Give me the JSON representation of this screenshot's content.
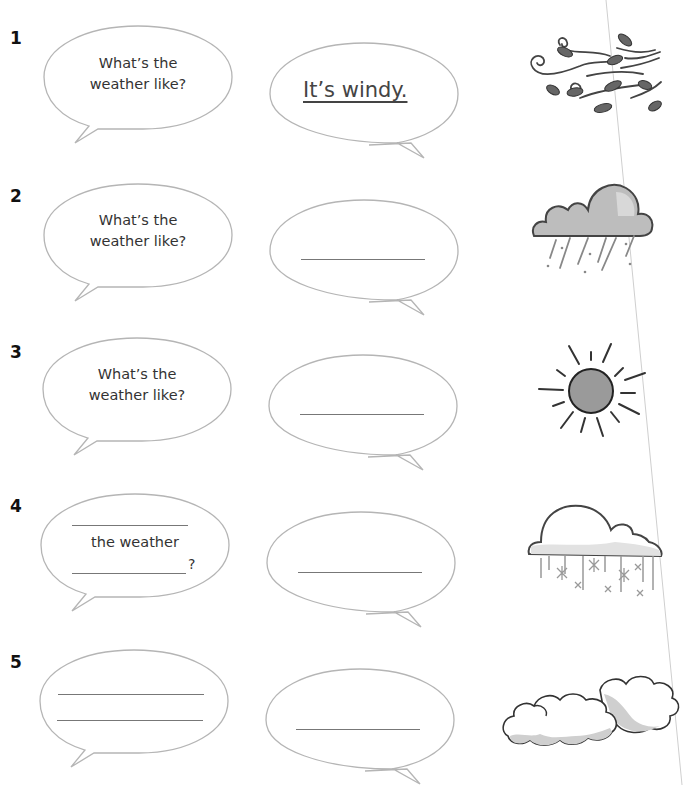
{
  "worksheet": {
    "items": [
      {
        "number": "1",
        "question_line1": "What’s the",
        "question_line2": "weather like?",
        "answer": "It’s windy.",
        "picture": "windy-icon"
      },
      {
        "number": "2",
        "question_line1": "What’s the",
        "question_line2": "weather like?",
        "answer": "",
        "picture": "rainy-cloud-icon"
      },
      {
        "number": "3",
        "question_line1": "What’s the",
        "question_line2": "weather like?",
        "answer": "",
        "picture": "sun-icon"
      },
      {
        "number": "4",
        "question_middle": "the weather",
        "question_end": "?",
        "answer": "",
        "picture": "snowy-cloud-icon"
      },
      {
        "number": "5",
        "answer": "",
        "picture": "cloudy-icon"
      }
    ]
  },
  "colors": {
    "bubble_stroke": "#b5b5b5",
    "line": "#777777",
    "icon_dark": "#333333",
    "icon_gray": "#8c8c8c"
  }
}
